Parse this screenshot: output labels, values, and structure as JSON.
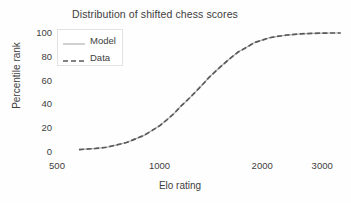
{
  "chart_data": {
    "type": "line",
    "title": "Distribution of shifted chess scores",
    "xlabel": "Elo rating",
    "ylabel": "Percentile rank",
    "xscale": "log",
    "yscale": "linear",
    "xlim": [
      500,
      3500
    ],
    "ylim": [
      0,
      100
    ],
    "grid": false,
    "xticks": [
      500,
      1000,
      2000,
      3000
    ],
    "xticklabels": [
      "500",
      "1000",
      "2000",
      "3000"
    ],
    "yticks": [
      0,
      20,
      40,
      60,
      80,
      100
    ],
    "yticklabels": [
      "0",
      "20",
      "40",
      "60",
      "80",
      "100"
    ],
    "legend_position": "upper left",
    "series": [
      {
        "name": "Model",
        "style": "solid",
        "color": "#b0b0b0",
        "x": [
          580,
          650,
          700,
          750,
          800,
          850,
          900,
          950,
          1000,
          1050,
          1100,
          1150,
          1200,
          1250,
          1300,
          1350,
          1400,
          1500,
          1600,
          1700,
          1800,
          1900,
          2000,
          2100,
          2200,
          2400,
          2600,
          2800,
          3000,
          3200,
          3400
        ],
        "values": [
          2,
          3,
          4,
          6,
          8,
          11,
          14,
          18,
          22,
          27,
          32,
          38,
          43,
          48,
          53,
          58,
          63,
          71,
          78,
          84,
          88,
          92,
          94,
          96,
          97,
          98.5,
          99.3,
          99.7,
          99.9,
          100,
          100
        ]
      },
      {
        "name": "Data",
        "style": "dashed",
        "color": "#5a5a5a",
        "x": [
          580,
          650,
          700,
          750,
          800,
          850,
          900,
          950,
          1000,
          1050,
          1100,
          1150,
          1200,
          1250,
          1300,
          1350,
          1400,
          1500,
          1600,
          1700,
          1800,
          1900,
          2000,
          2100,
          2200,
          2400,
          2600,
          2800,
          3000,
          3200,
          3400
        ],
        "values": [
          2,
          3,
          4,
          6,
          8,
          11,
          14,
          18,
          22,
          27,
          32,
          38,
          43,
          48,
          53,
          58,
          63,
          71,
          78,
          84,
          88,
          92,
          94,
          96,
          97,
          98.5,
          99.3,
          99.7,
          99.9,
          100,
          100
        ]
      }
    ]
  }
}
